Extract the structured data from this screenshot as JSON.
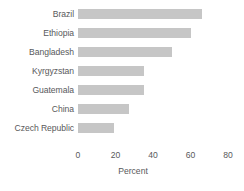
{
  "chart_data": {
    "type": "bar",
    "orientation": "horizontal",
    "title": "",
    "xlabel": "Percent",
    "ylabel": "",
    "categories": [
      "Brazil",
      "Ethiopia",
      "Bangladesh",
      "Kyrgyzstan",
      "Guatemala",
      "China",
      "Czech Republic"
    ],
    "values": [
      66,
      60,
      50,
      35,
      35,
      27,
      19
    ],
    "xlim": [
      0,
      80
    ],
    "xticks": [
      0,
      20,
      40,
      60,
      80
    ],
    "xtick_labels": [
      "0",
      "20",
      "40",
      "60",
      "80"
    ],
    "grid": false,
    "legend": null,
    "bar_color": "#c6c6c6",
    "text_color": "#58595b"
  }
}
